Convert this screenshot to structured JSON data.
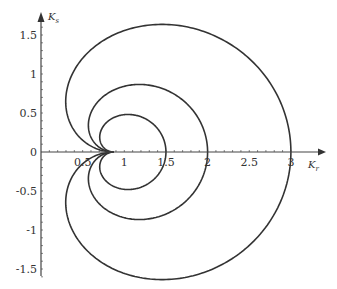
{
  "chart_data": {
    "type": "line",
    "title": "",
    "xlabel": "K_r",
    "ylabel": "K_s",
    "xlabel_main": "K",
    "xlabel_sub": "r",
    "ylabel_main": "K",
    "ylabel_sub": "s",
    "xlim": [
      0,
      3.2
    ],
    "ylim": [
      -1.6,
      1.6
    ],
    "grid": false,
    "legend": "none",
    "x_ticks": [
      0.5,
      1,
      1.5,
      2,
      2.5,
      3
    ],
    "x_tick_labels": [
      "0.5",
      "1",
      "1.5",
      "2",
      "2.5",
      "3"
    ],
    "y_ticks": [
      1.5,
      1,
      0.5,
      0,
      -0.5,
      -1,
      -1.5
    ],
    "y_tick_labels": [
      "1.5",
      "1",
      "0.5",
      "0",
      "-0.5",
      "-1",
      "-1.5"
    ],
    "cusp_point": [
      0.875,
      0
    ],
    "series": [
      {
        "name": "outer curve",
        "rightmost_x": 3.0,
        "max_y": 1.5,
        "min_y": -1.5,
        "leftmost_x": 0.44
      },
      {
        "name": "middle curve",
        "rightmost_x": 2.0,
        "max_y": 0.75,
        "min_y": -0.75
      },
      {
        "name": "inner curve",
        "rightmost_x": 1.5,
        "max_y": 0.37,
        "min_y": -0.37
      }
    ],
    "curve_color": "#333333"
  },
  "layout": {
    "origin_px": [
      41,
      152
    ],
    "x_px_per_unit": 83.3,
    "y_px_per_unit": 78
  }
}
